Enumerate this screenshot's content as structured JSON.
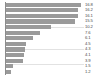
{
  "chart_data": {
    "type": "bar",
    "orientation": "horizontal",
    "title": "",
    "subtitle": "",
    "xlabel": "",
    "ylabel": "",
    "categories": [
      "",
      "",
      "",
      "",
      "",
      "",
      "",
      "",
      "",
      "",
      "",
      "",
      ""
    ],
    "values": [
      16.8,
      16.2,
      16.1,
      15.5,
      10.2,
      7.6,
      6.1,
      4.5,
      4.3,
      4.1,
      3.9,
      1.5,
      1.2
    ],
    "value_labels": [
      "16.8",
      "16.2",
      "16.1",
      "15.5",
      "10.2",
      "7.6",
      "6.1",
      "4.5",
      "4.3",
      "4.1",
      "3.9",
      "1.5",
      "1.2"
    ],
    "xlim": [
      0,
      17.5
    ],
    "grid": true,
    "legend": false,
    "bar_color": "#9a9a9a",
    "axis_color": "#8c8c8c",
    "label_color": "#4a4a4a",
    "background": "#ffffff"
  }
}
